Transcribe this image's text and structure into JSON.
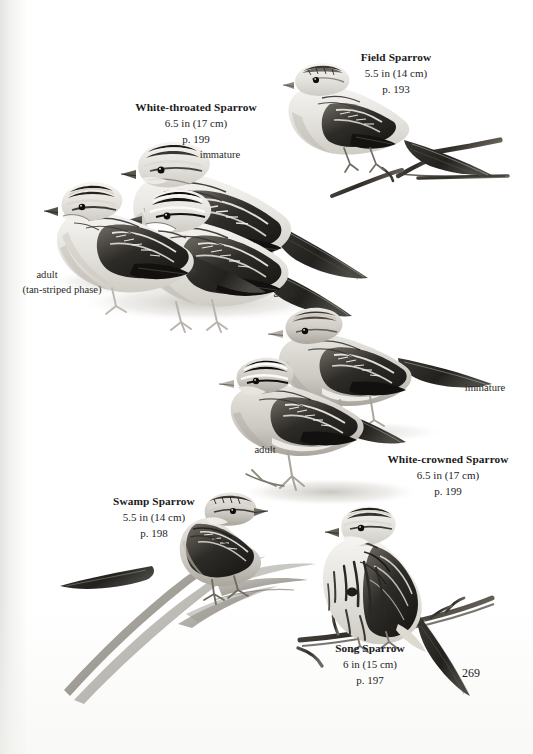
{
  "page": {
    "kind": "field-guide-plate",
    "folio": "269",
    "background_color": "#ffffff",
    "ink_color": "#1b1b1b"
  },
  "species": [
    {
      "id": "field-sparrow",
      "name": "Field Sparrow",
      "size": "5.5 in (14 cm)",
      "page_ref": "p. 193",
      "caption_left": 316,
      "caption_top": 50
    },
    {
      "id": "white-throated-sparrow",
      "name": "White-throated Sparrow",
      "size": "6.5 in (17 cm)",
      "page_ref": "p. 199",
      "caption_left": 86,
      "caption_top": 100
    },
    {
      "id": "white-crowned-sparrow",
      "name": "White-crowned Sparrow",
      "size": "6.5 in (17 cm)",
      "page_ref": "p. 199",
      "caption_left": 364,
      "caption_top": 452
    },
    {
      "id": "swamp-sparrow",
      "name": "Swamp Sparrow",
      "size": "5.5 in (14 cm)",
      "page_ref": "p. 198",
      "caption_left": 89,
      "caption_top": 494
    },
    {
      "id": "song-sparrow",
      "name": "Song Sparrow",
      "size": "6 in (15 cm)",
      "page_ref": "p. 197",
      "caption_left": 305,
      "caption_top": 641
    }
  ],
  "annotations": [
    {
      "id": "wts-immature",
      "text": "immature",
      "left": 185,
      "top": 148
    },
    {
      "id": "wts-adult-tan",
      "text": "adult",
      "left": 14,
      "top": 268
    },
    {
      "id": "wts-adult-tan-phase",
      "text": "(tan-striped phase)",
      "left": 0,
      "top": 283
    },
    {
      "id": "wts-adult",
      "text": "adult",
      "left": 258,
      "top": 287
    },
    {
      "id": "wcs-immature",
      "text": "immature",
      "left": 448,
      "top": 381
    },
    {
      "id": "wcs-adult",
      "text": "adult",
      "left": 239,
      "top": 443
    }
  ]
}
